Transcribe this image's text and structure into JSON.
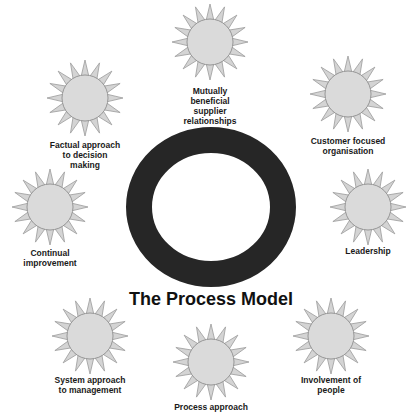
{
  "title": "The Process Model",
  "colors": {
    "ring": "#262626",
    "sun_fill": "#dadada",
    "sun_ray_fill": "#d4d4d4",
    "sun_stroke": "#8f8f8f",
    "text": "#1a1a1a",
    "background": "#ffffff"
  },
  "center": {
    "name": "process-ring",
    "shape": "ring"
  },
  "principles": [
    {
      "id": "mutually-beneficial",
      "icon": "sun-icon",
      "lines": [
        "Mutually",
        "beneficial",
        "supplier",
        "relationships"
      ]
    },
    {
      "id": "customer-focused",
      "icon": "sun-icon",
      "lines": [
        "Customer focused",
        "organisation"
      ]
    },
    {
      "id": "leadership",
      "icon": "sun-icon",
      "lines": [
        "Leadership"
      ]
    },
    {
      "id": "involvement-of-people",
      "icon": "sun-icon",
      "lines": [
        "Involvement of",
        "people"
      ]
    },
    {
      "id": "process-approach",
      "icon": "sun-icon",
      "lines": [
        "Process approach"
      ]
    },
    {
      "id": "system-approach",
      "icon": "sun-icon",
      "lines": [
        "System approach",
        "to management"
      ]
    },
    {
      "id": "continual-improvement",
      "icon": "sun-icon",
      "lines": [
        "Continual",
        "improvement"
      ]
    },
    {
      "id": "factual-approach",
      "icon": "sun-icon",
      "lines": [
        "Factual approach",
        "to decision",
        "making"
      ]
    }
  ]
}
